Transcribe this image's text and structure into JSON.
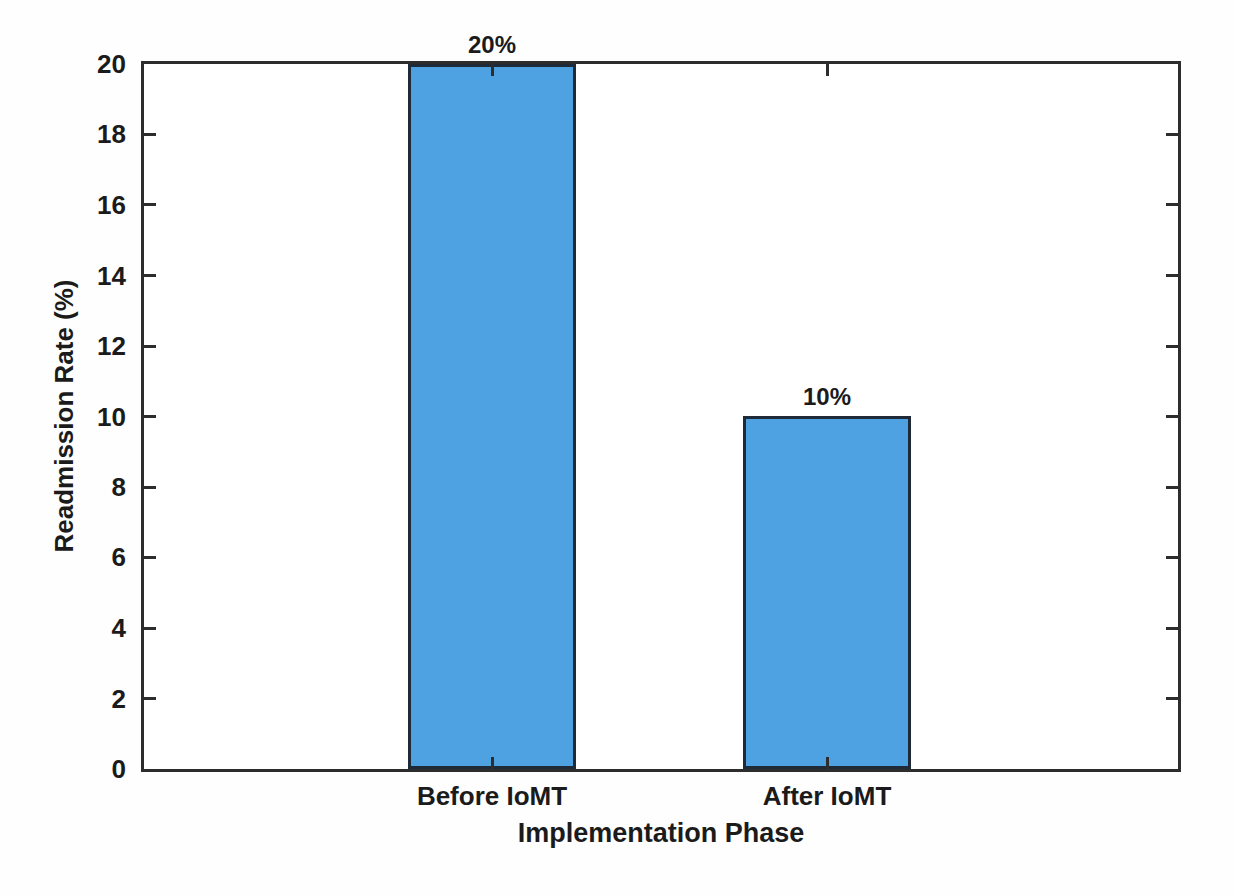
{
  "chart_data": {
    "type": "bar",
    "categories": [
      "Before IoMT",
      "After IoMT"
    ],
    "values": [
      20,
      10
    ],
    "bar_value_labels": [
      "20%",
      "10%"
    ],
    "xlabel": "Implementation Phase",
    "ylabel": "Readmission Rate (%)",
    "ylim": [
      0,
      20
    ],
    "yticks": [
      0,
      2,
      4,
      6,
      8,
      10,
      12,
      14,
      16,
      18,
      20
    ],
    "grid": false,
    "legend_position": "none",
    "colors": {
      "bar_fill": "#4fa2e2",
      "bar_edge": "#1f2a38",
      "axis": "#2d2d2d",
      "text": "#1b1b1b",
      "background": "#ffffff"
    }
  }
}
